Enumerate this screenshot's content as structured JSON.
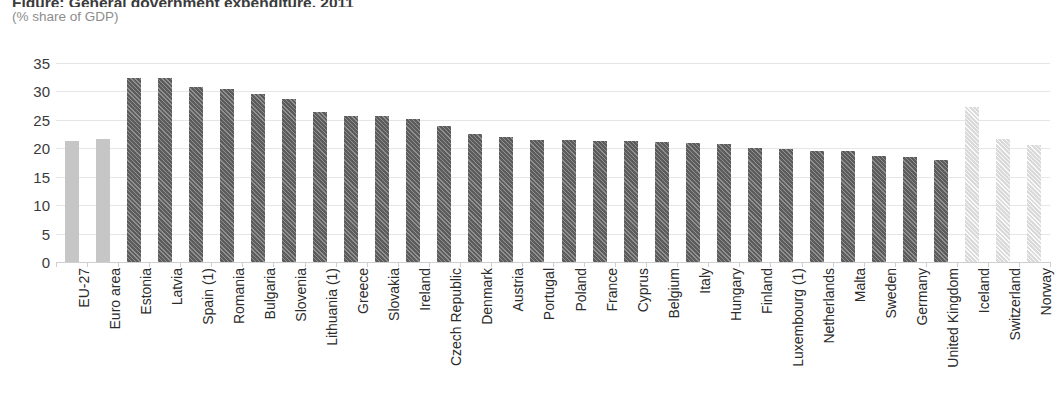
{
  "chart_data": {
    "type": "bar",
    "title": "Figure: General government expenditure, 2011",
    "subtitle": "(% share of GDP)",
    "xlabel": "",
    "ylabel": "",
    "ylim": [
      0,
      35
    ],
    "yticks": [
      0,
      5,
      10,
      15,
      20,
      25,
      30,
      35
    ],
    "grid": true,
    "legend": "none",
    "categories": [
      "EU-27",
      "Euro area",
      "Estonia",
      "Latvia",
      "Spain (1)",
      "Romania",
      "Bulgaria",
      "Slovenia",
      "Lithuania (1)",
      "Greece",
      "Slovakia",
      "Ireland",
      "Czech Republic",
      "Denmark",
      "Austria",
      "Portugal",
      "Poland",
      "France",
      "Cyprus",
      "Belgium",
      "Italy",
      "Hungary",
      "Finland",
      "Luxembourg (1)",
      "Netherlands",
      "Malta",
      "Sweden",
      "Germany",
      "United Kingdom",
      "Iceland",
      "Switzerland",
      "Norway"
    ],
    "values": [
      21.2,
      21.7,
      32.3,
      32.3,
      30.8,
      30.4,
      29.6,
      28.6,
      26.4,
      25.6,
      25.6,
      25.1,
      23.9,
      22.6,
      22.0,
      21.5,
      21.4,
      21.2,
      21.2,
      21.1,
      20.9,
      20.8,
      20.1,
      19.9,
      19.6,
      19.5,
      18.7,
      18.5,
      17.9,
      27.2,
      21.6,
      20.5
    ],
    "bar_styles": [
      "solid-light",
      "solid-light",
      "hatch-dark",
      "hatch-dark",
      "hatch-dark",
      "hatch-dark",
      "hatch-dark",
      "hatch-dark",
      "hatch-dark",
      "hatch-dark",
      "hatch-dark",
      "hatch-dark",
      "hatch-dark",
      "hatch-dark",
      "hatch-dark",
      "hatch-dark",
      "hatch-dark",
      "hatch-dark",
      "hatch-dark",
      "hatch-dark",
      "hatch-dark",
      "hatch-dark",
      "hatch-dark",
      "hatch-dark",
      "hatch-dark",
      "hatch-dark",
      "hatch-dark",
      "hatch-dark",
      "hatch-dark",
      "hatch-light",
      "hatch-light",
      "hatch-light"
    ],
    "colors": {
      "aggregate_bar": "#c6c6c6",
      "member_bar": "#5c5c5c",
      "nonmember_bar": "#dadada",
      "gridline": "#e6e6e6",
      "axis": "#cfcfcf",
      "tick_label": "#3b3b3b",
      "category_label": "#2b2b2b",
      "subtitle": "#8d8d8d"
    }
  }
}
